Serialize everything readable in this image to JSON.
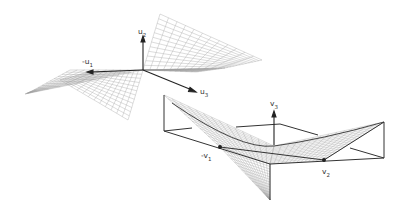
{
  "figure": {
    "top_plot": {
      "description": "saddle surface mesh with orthogonal axes",
      "axes": [
        {
          "id": "u2",
          "label": "u",
          "sub": "2",
          "direction": "up"
        },
        {
          "id": "neg_u1",
          "label": "-u",
          "sub": "1",
          "direction": "left"
        },
        {
          "id": "u3",
          "label": "u",
          "sub": "3",
          "direction": "down-right"
        }
      ]
    },
    "bottom_plot": {
      "description": "saddle surface mesh inside wireframe box",
      "axes": [
        {
          "id": "v3",
          "label": "v",
          "sub": "3",
          "direction": "up"
        },
        {
          "id": "neg_v1",
          "label": "-v",
          "sub": "1",
          "direction": "left"
        },
        {
          "id": "v2",
          "label": "v",
          "sub": "2",
          "direction": "right"
        }
      ]
    },
    "colors": {
      "mesh": "#9a9a9a",
      "axis": "#222222",
      "box": "#333333",
      "background": "#ffffff"
    }
  }
}
